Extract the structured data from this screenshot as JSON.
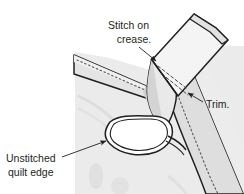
{
  "figure": {
    "background_color": "#ffffff",
    "width": 244,
    "height": 194
  },
  "colors": {
    "outline": "#231f20",
    "quilt_body_fill": "#ebebeb",
    "quilt_shadow_fill": "#dcdcdc",
    "binding_strip_fill": "#f4f4f4",
    "binding_strip_shade": "#d9d9d9",
    "binding_strip_dark": "#c9c9c9",
    "unstitched_loop_fill": "#ffffff",
    "stitch_dash_color": "#5a5a5a",
    "leader_line_color": "#231f20",
    "label_text_color": "#231f20"
  },
  "labels": [
    {
      "id": "stitch-on-crease",
      "name": "label-stitch-on-crease",
      "lines": [
        "Stitch on",
        "crease."
      ],
      "line1": "Stitch on",
      "line2": "crease.",
      "text_x": 130,
      "line1_y": 29,
      "line2_y": 43,
      "anchor": "middle",
      "leader": {
        "from_x": 139,
        "from_y": 47,
        "to_x": 156,
        "to_y": 61,
        "arrow": true
      }
    },
    {
      "id": "trim",
      "name": "label-trim",
      "lines": [
        "Trim."
      ],
      "line1": "Trim.",
      "text_x": 206,
      "line1_y": 108,
      "anchor": "start",
      "leader": {
        "from_x": 203,
        "from_y": 102,
        "to_x": 188,
        "to_y": 93,
        "arrow": true
      }
    },
    {
      "id": "unstitched-quilt-edge",
      "name": "label-unstitched-quilt-edge",
      "lines": [
        "Unstitched",
        "quilt edge"
      ],
      "line1": "Unstitched",
      "line2": "quilt edge",
      "text_x": 6,
      "line1_y": 162,
      "line2_y": 176,
      "anchor": "start",
      "leader": {
        "from_x": 62,
        "from_y": 157,
        "to_x": 106,
        "to_y": 141,
        "arrow": true
      }
    }
  ],
  "shapes": {
    "quilt_body": {
      "name": "quilt-body",
      "description": "Light gray quilt panel occupying lower and right portion"
    },
    "binding_strip_upper": {
      "name": "binding-strip-upper-right",
      "description": "Pale binding strip angled to upper right with folded doubled edge"
    },
    "binding_strip_left": {
      "name": "binding-strip-left-diagonal",
      "description": "Binding strip running diagonally from left edge toward center with stitch dashes"
    },
    "binding_strip_lower": {
      "name": "binding-strip-lower-right",
      "description": "Binding strip curving down the right side with stitch dashes"
    },
    "unstitched_loop": {
      "name": "unstitched-quilt-edge-loop",
      "description": "White open loop showing the unstitched quilt edge"
    }
  },
  "stitch_lines": {
    "left_strip_dashes": {
      "name": "stitch-dashes-left-strip",
      "dash_pattern": "1.6 2.6"
    },
    "lower_strip_dashes": {
      "name": "stitch-dashes-lower-strip",
      "dash_pattern": "1.6 2.6"
    },
    "crease_dashes": {
      "name": "crease-dashes-upper-strip",
      "dash_pattern": "3 2.5"
    }
  }
}
